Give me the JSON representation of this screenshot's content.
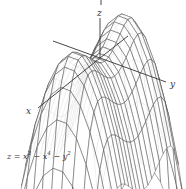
{
  "figure": {
    "type": "3d-wireframe-surface",
    "axes": {
      "x_label": "x",
      "y_label": "y",
      "z_label": "z"
    },
    "formula": {
      "lhs": "z",
      "rhs_terms": [
        "x",
        "2",
        "x",
        "4",
        "y",
        "2"
      ],
      "text": "z = x² − x⁴ − y²"
    },
    "surface": {
      "x_range": [
        -1.35,
        1.35
      ],
      "y_range": [
        -1.1,
        1.1
      ],
      "x_steps": 24,
      "y_steps": 9
    }
  },
  "colors": {
    "line": "#444444",
    "axis": "#333333",
    "background": "#ffffff"
  }
}
